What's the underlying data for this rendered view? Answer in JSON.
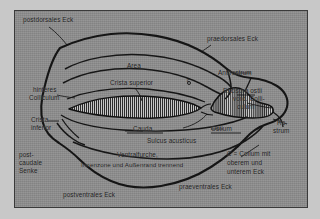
{
  "figure": {
    "background_color": "#8e8e8e",
    "ink_color": "#141414",
    "page_color": "#c8c8c8"
  },
  "labels": {
    "postdorsales_eck": "postdorsales Eck",
    "praedorsales_eck": "praedorsales Eck",
    "area": "Area",
    "crista_superior": "Crista superior",
    "antirostrum": "Antirostrum",
    "excisura_ostii_l1": "Excisura ostii",
    "excisura_ostii_l2": "vord. Colli-",
    "excisura_ostii_l3": "culum",
    "hinteres_colliculum_l1": "hinteres",
    "hinteres_colliculum_l2": "Colliculum",
    "crista_inferior_l1": "Crista",
    "crista_inferior_l2": "inferior",
    "cauda": "Cauda",
    "ostium": "Ostium",
    "sulcus_acusticus": "Sulcus acusticus",
    "rostrum_l1": "Ro-",
    "rostrum_l2": "strum",
    "postcaudale_senke_l1": "post-",
    "postcaudale_senke_l2": "caudale",
    "postcaudale_senke_l3": "Senke",
    "ventralfurche_l1": "Ventralfurche,",
    "ventralfurche_l2": "Innenzone und Außenrand trennend",
    "postventrales_eck": "postventrales Eck",
    "praeventrales_eck": "praeventrales Eck",
    "legend_l1": "C = Collum mit",
    "legend_l2": "oberem und",
    "legend_l3": "unterem Eck",
    "collum_marker": "c"
  },
  "structures": [
    {
      "name": "outer-outline",
      "kind": "closed-contour"
    },
    {
      "name": "cauda-hatched-region",
      "kind": "hatched-blob"
    },
    {
      "name": "ostium-hatched-region",
      "kind": "hatched-blob"
    },
    {
      "name": "sulcus-acusticus-outline",
      "kind": "open-contour"
    },
    {
      "name": "crista-superior-ridge",
      "kind": "open-contour"
    },
    {
      "name": "crista-inferior-ridge",
      "kind": "open-contour"
    },
    {
      "name": "ventral-furrow",
      "kind": "open-contour"
    },
    {
      "name": "area-boundary",
      "kind": "open-contour"
    }
  ]
}
